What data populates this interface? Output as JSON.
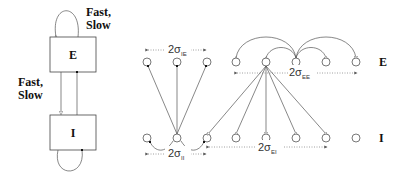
{
  "schematic": {
    "populations": [
      {
        "id": "E",
        "label": "E"
      },
      {
        "id": "I",
        "label": "I"
      }
    ],
    "self_loop_label_line1": "Fast,",
    "self_loop_label_line2": "Slow",
    "between_label_line1": "Fast,",
    "between_label_line2": "Slow"
  },
  "network": {
    "row_labels": {
      "E": "E",
      "I": "I"
    },
    "widths": [
      {
        "id": "IE",
        "prefix": "2σ",
        "subscript": "IE"
      },
      {
        "id": "II",
        "prefix": "2σ",
        "subscript": "II"
      },
      {
        "id": "EE",
        "prefix": "2σ",
        "subscript": "EE"
      },
      {
        "id": "EI",
        "prefix": "2σ",
        "subscript": "EI"
      }
    ]
  },
  "colors": {
    "stroke": "#555555",
    "text": "#111111",
    "dotted": "#888888"
  }
}
